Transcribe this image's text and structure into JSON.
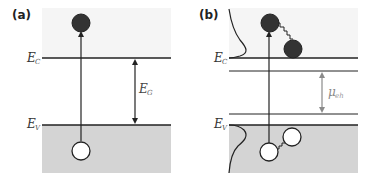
{
  "figure": {
    "panel_a": {
      "label": "(a)",
      "conduction_band_label": "E",
      "conduction_band_sub": "C",
      "valence_band_label": "E",
      "valence_band_sub": "V",
      "gap_label": "E",
      "gap_sub": "G",
      "particles": [
        {
          "type": "electron",
          "fill": "filled"
        },
        {
          "type": "hole",
          "fill": "open"
        }
      ],
      "arrow": "excitation from valence band to conduction band"
    },
    "panel_b": {
      "label": "(b)",
      "conduction_band_label": "E",
      "conduction_band_sub": "C",
      "valence_band_label": "E",
      "valence_band_sub": "V",
      "chemical_potential_label": "μ",
      "chemical_potential_sub": "eh",
      "particles": [
        {
          "type": "electron",
          "fill": "filled",
          "position": "excited"
        },
        {
          "type": "electron",
          "fill": "filled",
          "position": "thermalized"
        },
        {
          "type": "hole",
          "fill": "open",
          "position": "excited"
        },
        {
          "type": "hole",
          "fill": "open",
          "position": "thermalized"
        }
      ],
      "arrow": "excitation with thermalization (wavy lines)",
      "distributions": [
        "electron distribution near E_C",
        "hole distribution near E_V"
      ]
    },
    "colors": {
      "upper_band_bg": "#f5f5f5",
      "lower_band_bg": "#d4d4d4",
      "line": "#222222",
      "electron": "#333333",
      "hole": "#ffffff",
      "mu_arrow": "#8a8a8a"
    }
  }
}
